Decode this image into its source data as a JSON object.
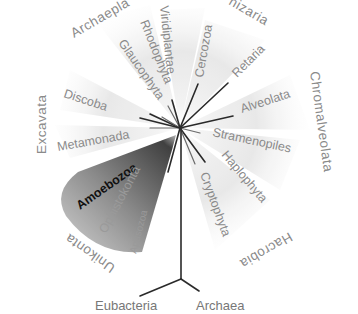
{
  "diagram": {
    "type": "unrooted eukaryotic tree of life",
    "center": [
      180,
      128
    ],
    "supergroups": [
      {
        "name": "Archaeplastida",
        "shown_text": "Archaepla",
        "members": [
          "Glaucophyta",
          "Rhodophyta",
          "Viridiplantae"
        ]
      },
      {
        "name": "Rhizaria",
        "shown_text": "hizaria",
        "members": [
          "Cercozoa",
          "Retaria"
        ]
      },
      {
        "name": "Chromalveolata",
        "shown_text": "Chromalveolata",
        "members": [
          "Alveolata",
          "Stramenopiles"
        ]
      },
      {
        "name": "Hacrobia",
        "shown_text": "Hacrobia",
        "members": [
          "Haptophyta",
          "Cryptophyta"
        ]
      },
      {
        "name": "Unikonta",
        "shown_text": "Unikonta",
        "members": [
          "Amoebozoa",
          "Opisthokonta",
          "Apusozoa"
        ]
      },
      {
        "name": "Excavata",
        "shown_text": "Excavata",
        "members": [
          "Discoba",
          "Metamonada"
        ]
      }
    ],
    "labels": {
      "archaeplastida": "Archaepla",
      "rhizaria": "hizaria",
      "chromalveolata": "Chromalveolata",
      "hacrobia": "Hacrobia",
      "unikonta": "Unikonta",
      "excavata": "Excavata",
      "glaucophyta": "Glaucophyta",
      "rhodophyta": "Rhodophyta",
      "viridiplantae": "Viridiplantae",
      "cercozoa": "Cercozoa",
      "retaria": "Retaria",
      "alveolata": "Alveolata",
      "stramenopiles": "Stramenopiles",
      "haptophyta": "Haplophyta",
      "cryptophyta": "Cryptophyta",
      "amoebozoa": "Amoebozoa",
      "opisthokonta": "Ophistokonta",
      "apusozoa": "Apusozoa",
      "discoba": "Discoba",
      "metamonada": "Metamonada",
      "eubacteria": "Eubacteria",
      "archaea": "Archaea"
    },
    "highlighted_group": "Unikonta",
    "colors": {
      "label_gray": "#8a8a8a",
      "branch": "#2a2a2a",
      "highlight_wedge_dark": "#5a5a5a",
      "highlight_wedge_light": "#d8d8d8",
      "fan_light": "#eeeeee"
    }
  }
}
